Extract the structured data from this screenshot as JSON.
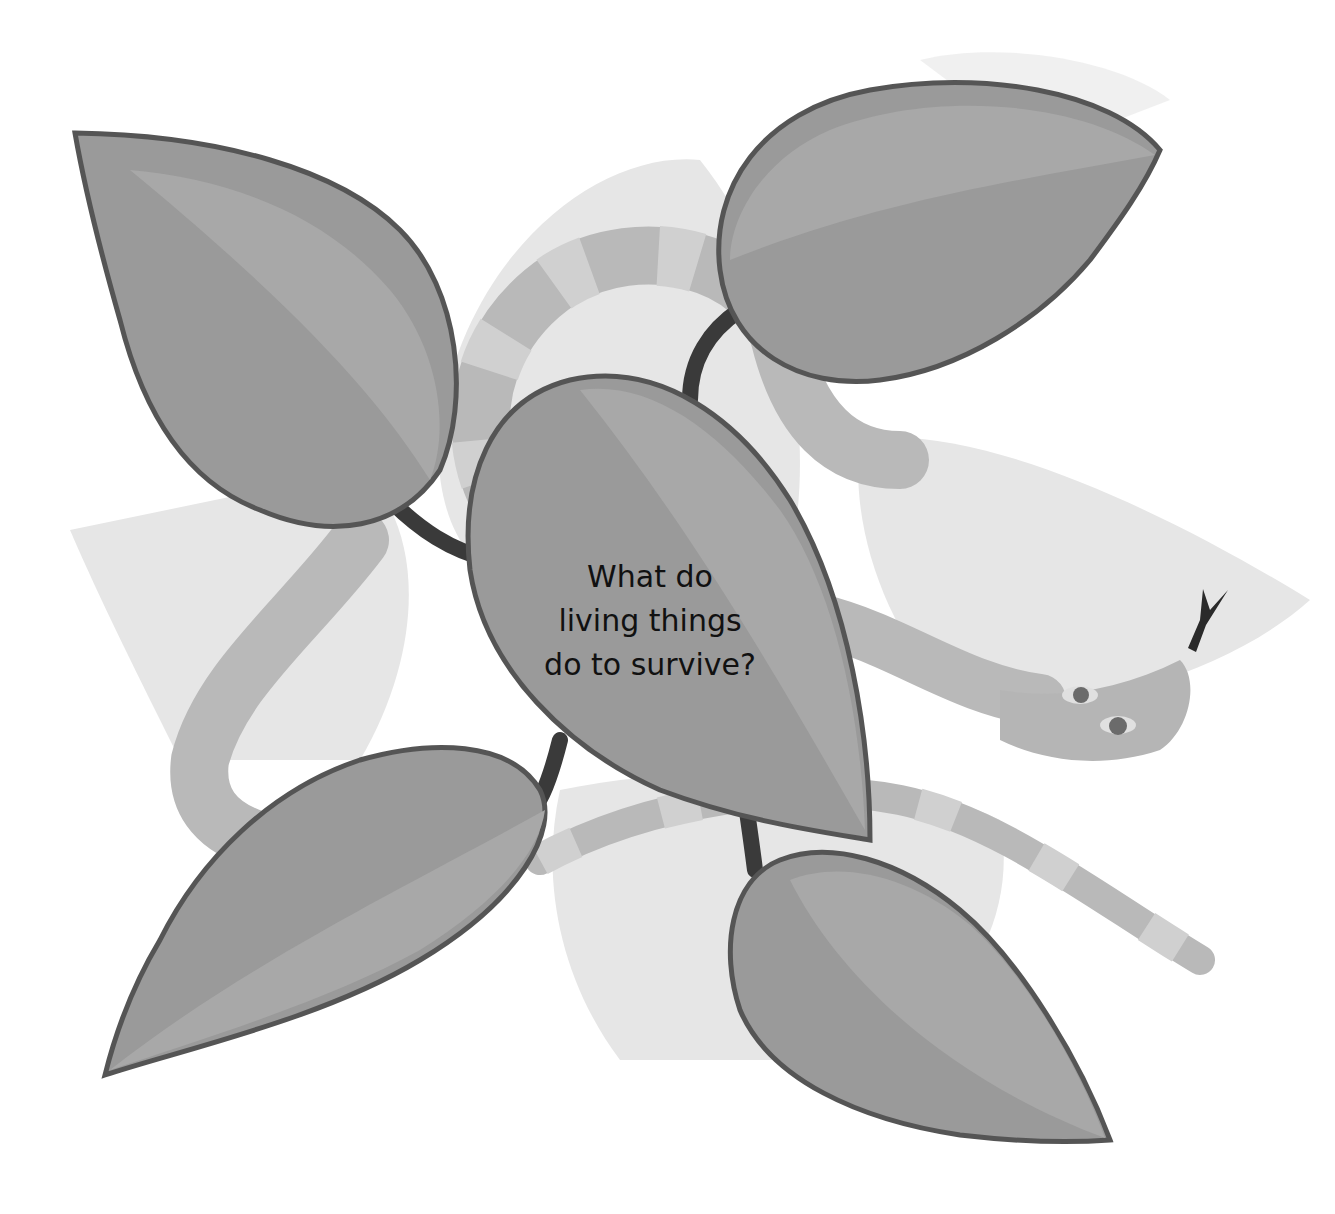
{
  "diagram": {
    "type": "concept-web",
    "central_question": {
      "line1": "What do",
      "line2": "living things",
      "line3": "do to survive?"
    },
    "nodes": [
      {
        "id": "leaf-top-left",
        "label": ""
      },
      {
        "id": "leaf-top-right",
        "label": ""
      },
      {
        "id": "leaf-bottom-left",
        "label": ""
      },
      {
        "id": "leaf-bottom-right",
        "label": ""
      }
    ],
    "decorations": [
      "snake",
      "background-leaves"
    ],
    "colors": {
      "leaf_fill": "#9a9a9a",
      "leaf_outline": "#555555",
      "stem": "#3a3a3a",
      "snake": "#b9b9b9",
      "background_leaf": "#e6e6e6"
    }
  }
}
